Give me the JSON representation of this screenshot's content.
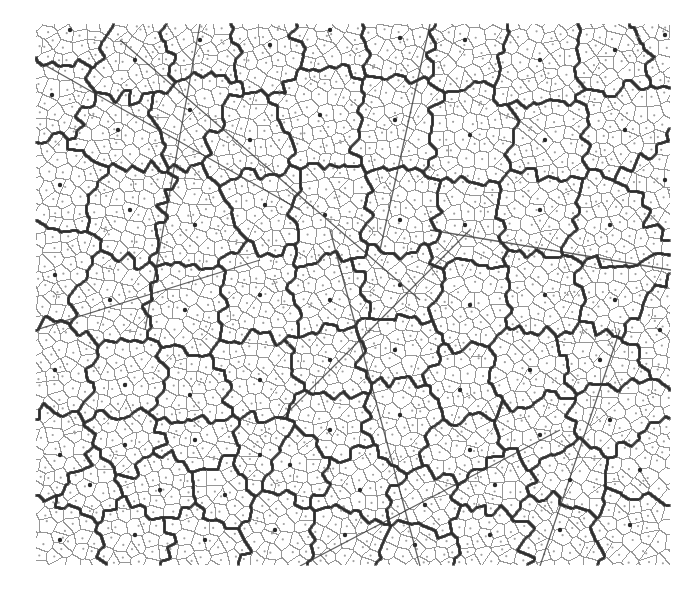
{
  "canvas": {
    "width": 698,
    "height": 594,
    "background": "#ffffff"
  },
  "plot_area": {
    "x0": 36,
    "y0": 24,
    "x1": 671,
    "y1": 566
  },
  "colors": {
    "fine_edge": "#8a8a8a",
    "fine_seed": "#a0a0a0",
    "coarse_edge": "#2e2e2e",
    "coarse_seed": "#2a2a2a",
    "straight_line": "#3a3a3a"
  },
  "stroke": {
    "fine_edge_width": 1.0,
    "coarse_edge_width": 2.6,
    "straight_line_width": 1.3
  },
  "fine_cells": {
    "approx_spacing_px": 14,
    "random_seed": 7,
    "jitter": 0.42
  },
  "coarse_cells": {
    "approx_count": 50,
    "seeds": [
      [
        70,
        30
      ],
      [
        135,
        60
      ],
      [
        200,
        40
      ],
      [
        270,
        45
      ],
      [
        330,
        30
      ],
      [
        400,
        38
      ],
      [
        465,
        40
      ],
      [
        540,
        60
      ],
      [
        615,
        50
      ],
      [
        665,
        35
      ],
      [
        52,
        95
      ],
      [
        118,
        130
      ],
      [
        190,
        110
      ],
      [
        250,
        140
      ],
      [
        320,
        115
      ],
      [
        395,
        120
      ],
      [
        470,
        135
      ],
      [
        545,
        140
      ],
      [
        625,
        130
      ],
      [
        60,
        185
      ],
      [
        130,
        210
      ],
      [
        195,
        225
      ],
      [
        265,
        205
      ],
      [
        325,
        215
      ],
      [
        400,
        220
      ],
      [
        465,
        225
      ],
      [
        540,
        210
      ],
      [
        610,
        225
      ],
      [
        665,
        180
      ],
      [
        55,
        275
      ],
      [
        110,
        300
      ],
      [
        185,
        310
      ],
      [
        260,
        295
      ],
      [
        330,
        300
      ],
      [
        400,
        285
      ],
      [
        470,
        305
      ],
      [
        545,
        295
      ],
      [
        615,
        300
      ],
      [
        55,
        370
      ],
      [
        125,
        385
      ],
      [
        190,
        395
      ],
      [
        260,
        380
      ],
      [
        330,
        360
      ],
      [
        395,
        350
      ],
      [
        460,
        390
      ],
      [
        530,
        370
      ],
      [
        600,
        360
      ],
      [
        660,
        330
      ],
      [
        60,
        455
      ],
      [
        125,
        445
      ],
      [
        195,
        440
      ],
      [
        260,
        455
      ],
      [
        330,
        430
      ],
      [
        400,
        415
      ],
      [
        470,
        450
      ],
      [
        540,
        435
      ],
      [
        610,
        420
      ],
      [
        90,
        485
      ],
      [
        160,
        490
      ],
      [
        225,
        495
      ],
      [
        290,
        465
      ],
      [
        360,
        490
      ],
      [
        425,
        505
      ],
      [
        495,
        485
      ],
      [
        570,
        480
      ],
      [
        640,
        470
      ],
      [
        60,
        540
      ],
      [
        135,
        535
      ],
      [
        205,
        540
      ],
      [
        275,
        530
      ],
      [
        345,
        535
      ],
      [
        415,
        545
      ],
      [
        490,
        535
      ],
      [
        560,
        530
      ],
      [
        630,
        525
      ]
    ]
  },
  "straight_lines": [
    [
      [
        36,
        60
      ],
      [
        300,
        210
      ]
    ],
    [
      [
        120,
        40
      ],
      [
        420,
        300
      ]
    ],
    [
      [
        200,
        24
      ],
      [
        145,
        330
      ]
    ],
    [
      [
        280,
        420
      ],
      [
        470,
        230
      ]
    ],
    [
      [
        330,
        230
      ],
      [
        420,
        566
      ]
    ],
    [
      [
        430,
        24
      ],
      [
        380,
        250
      ]
    ],
    [
      [
        430,
        230
      ],
      [
        671,
        270
      ]
    ],
    [
      [
        300,
        566
      ],
      [
        560,
        430
      ]
    ],
    [
      [
        540,
        566
      ],
      [
        620,
        330
      ]
    ],
    [
      [
        36,
        330
      ],
      [
        260,
        260
      ]
    ]
  ]
}
